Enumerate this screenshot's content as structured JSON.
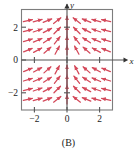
{
  "figure": {
    "caption": "(B)",
    "kind": "direction-field-plot"
  },
  "axes": {
    "x_label": "x",
    "y_label": "y",
    "x_ticks": [
      {
        "value": -2,
        "label": "-2"
      },
      {
        "value": 0,
        "label": "0"
      },
      {
        "value": 2,
        "label": "2"
      }
    ],
    "y_ticks": [
      {
        "value": 2,
        "label": "2"
      },
      {
        "value": 0,
        "label": "0"
      },
      {
        "value": -2,
        "label": "-2"
      }
    ],
    "origin_label": "0"
  },
  "style": {
    "field_color": "#d4495a",
    "frame_color": "#7d7d7d",
    "axis_color": "#555555",
    "text_color": "#1b1b1b",
    "background": "#ffffff"
  },
  "chart_data": {
    "type": "scatter",
    "title": "",
    "subtitle": "",
    "xlabel": "x",
    "ylabel": "y",
    "xlim": [
      -2.8,
      2.8
    ],
    "ylim": [
      -3.05,
      3.05
    ],
    "grid": false,
    "legend": null,
    "annotations": [
      "(B)"
    ],
    "field_grid": {
      "x": [
        -2.4,
        -1.8,
        -1.2,
        -0.6,
        0,
        0.6,
        1.2,
        1.8,
        2.4
      ],
      "y": [
        -2.4,
        -1.8,
        -1.2,
        -0.6,
        0.6,
        1.2,
        1.8,
        2.4
      ]
    },
    "segments": [
      {
        "x": -2.4,
        "y": 2.4,
        "angle_deg": 12
      },
      {
        "x": -1.8,
        "y": 2.4,
        "angle_deg": 16
      },
      {
        "x": -1.2,
        "y": 2.4,
        "angle_deg": 22
      },
      {
        "x": -0.6,
        "y": 2.4,
        "angle_deg": 38
      },
      {
        "x": 0,
        "y": 2.4,
        "angle_deg": 90
      },
      {
        "x": 0.6,
        "y": 2.4,
        "angle_deg": 142
      },
      {
        "x": 1.2,
        "y": 2.4,
        "angle_deg": 158
      },
      {
        "x": 1.8,
        "y": 2.4,
        "angle_deg": 164
      },
      {
        "x": 2.4,
        "y": 2.4,
        "angle_deg": 168
      },
      {
        "x": -2.4,
        "y": 1.8,
        "angle_deg": 14
      },
      {
        "x": -1.8,
        "y": 1.8,
        "angle_deg": 19
      },
      {
        "x": -1.2,
        "y": 1.8,
        "angle_deg": 27
      },
      {
        "x": -0.6,
        "y": 1.8,
        "angle_deg": 45
      },
      {
        "x": 0,
        "y": 1.8,
        "angle_deg": 90
      },
      {
        "x": 0.6,
        "y": 1.8,
        "angle_deg": 135
      },
      {
        "x": 1.2,
        "y": 1.8,
        "angle_deg": 153
      },
      {
        "x": 1.8,
        "y": 1.8,
        "angle_deg": 161
      },
      {
        "x": 2.4,
        "y": 1.8,
        "angle_deg": 166
      },
      {
        "x": -2.4,
        "y": 1.2,
        "angle_deg": 17
      },
      {
        "x": -1.8,
        "y": 1.2,
        "angle_deg": 23
      },
      {
        "x": -1.2,
        "y": 1.2,
        "angle_deg": 33
      },
      {
        "x": -0.6,
        "y": 1.2,
        "angle_deg": 52
      },
      {
        "x": 0,
        "y": 1.2,
        "angle_deg": 90
      },
      {
        "x": 0.6,
        "y": 1.2,
        "angle_deg": 128
      },
      {
        "x": 1.2,
        "y": 1.2,
        "angle_deg": 147
      },
      {
        "x": 1.8,
        "y": 1.2,
        "angle_deg": 157
      },
      {
        "x": 2.4,
        "y": 1.2,
        "angle_deg": 163
      },
      {
        "x": -2.4,
        "y": 0.6,
        "angle_deg": 22
      },
      {
        "x": -1.8,
        "y": 0.6,
        "angle_deg": 29
      },
      {
        "x": -1.2,
        "y": 0.6,
        "angle_deg": 41
      },
      {
        "x": -0.6,
        "y": 0.6,
        "angle_deg": 62
      },
      {
        "x": 0,
        "y": 0.6,
        "angle_deg": 90
      },
      {
        "x": 0.6,
        "y": 0.6,
        "angle_deg": 118
      },
      {
        "x": 1.2,
        "y": 0.6,
        "angle_deg": 139
      },
      {
        "x": 1.8,
        "y": 0.6,
        "angle_deg": 151
      },
      {
        "x": 2.4,
        "y": 0.6,
        "angle_deg": 158
      },
      {
        "x": -2.4,
        "y": -0.6,
        "angle_deg": 22
      },
      {
        "x": -1.8,
        "y": -0.6,
        "angle_deg": 29
      },
      {
        "x": -1.2,
        "y": -0.6,
        "angle_deg": 41
      },
      {
        "x": -0.6,
        "y": -0.6,
        "angle_deg": 62
      },
      {
        "x": 0,
        "y": -0.6,
        "angle_deg": 90
      },
      {
        "x": 0.6,
        "y": -0.6,
        "angle_deg": 118
      },
      {
        "x": 1.2,
        "y": -0.6,
        "angle_deg": 139
      },
      {
        "x": 1.8,
        "y": -0.6,
        "angle_deg": 151
      },
      {
        "x": 2.4,
        "y": -0.6,
        "angle_deg": 158
      },
      {
        "x": -2.4,
        "y": -1.2,
        "angle_deg": 17
      },
      {
        "x": -1.8,
        "y": -1.2,
        "angle_deg": 23
      },
      {
        "x": -1.2,
        "y": -1.2,
        "angle_deg": 33
      },
      {
        "x": -0.6,
        "y": -1.2,
        "angle_deg": 52
      },
      {
        "x": 0,
        "y": -1.2,
        "angle_deg": 90
      },
      {
        "x": 0.6,
        "y": -1.2,
        "angle_deg": 128
      },
      {
        "x": 1.2,
        "y": -1.2,
        "angle_deg": 147
      },
      {
        "x": 1.8,
        "y": -1.2,
        "angle_deg": 157
      },
      {
        "x": 2.4,
        "y": -1.2,
        "angle_deg": 163
      },
      {
        "x": -2.4,
        "y": -1.8,
        "angle_deg": 14
      },
      {
        "x": -1.8,
        "y": -1.8,
        "angle_deg": 19
      },
      {
        "x": -1.2,
        "y": -1.8,
        "angle_deg": 27
      },
      {
        "x": -0.6,
        "y": -1.8,
        "angle_deg": 45
      },
      {
        "x": 0,
        "y": -1.8,
        "angle_deg": 90
      },
      {
        "x": 0.6,
        "y": -1.8,
        "angle_deg": 135
      },
      {
        "x": 1.2,
        "y": -1.8,
        "angle_deg": 153
      },
      {
        "x": 1.8,
        "y": -1.8,
        "angle_deg": 161
      },
      {
        "x": 2.4,
        "y": -1.8,
        "angle_deg": 166
      },
      {
        "x": -2.4,
        "y": -2.4,
        "angle_deg": 12
      },
      {
        "x": -1.8,
        "y": -2.4,
        "angle_deg": 16
      },
      {
        "x": -1.2,
        "y": -2.4,
        "angle_deg": 22
      },
      {
        "x": -0.6,
        "y": -2.4,
        "angle_deg": 38
      },
      {
        "x": 0,
        "y": -2.4,
        "angle_deg": 90
      },
      {
        "x": 0.6,
        "y": -2.4,
        "angle_deg": 142
      },
      {
        "x": 1.2,
        "y": -2.4,
        "angle_deg": 158
      },
      {
        "x": 1.8,
        "y": -2.4,
        "angle_deg": 164
      },
      {
        "x": 2.4,
        "y": -2.4,
        "angle_deg": 168
      }
    ]
  }
}
